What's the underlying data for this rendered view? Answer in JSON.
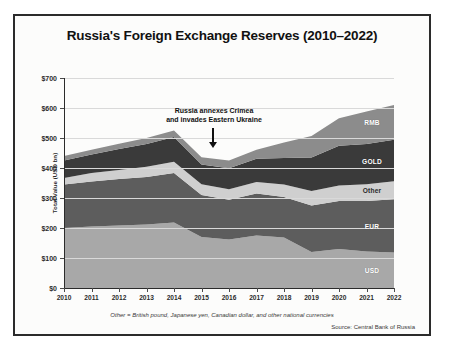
{
  "chart_data": {
    "type": "area",
    "stacked": true,
    "title": "Russia's Foreign Exchange Reserves (2010–2022)",
    "xlabel": "",
    "ylabel": "Total Value (USD bn)",
    "ylim": [
      0,
      700
    ],
    "ytick_step": 100,
    "ytick_labels": [
      "$0",
      "$100",
      "$200",
      "$300",
      "$400",
      "$500",
      "$600",
      "$700"
    ],
    "grid": true,
    "legend_position": "inline-right-edge",
    "categories": [
      2010,
      2011,
      2012,
      2013,
      2014,
      2015,
      2016,
      2017,
      2018,
      2019,
      2020,
      2021,
      2022
    ],
    "tick_labels": [
      "2010",
      "2011",
      "2012",
      "2013",
      "2014",
      "2015",
      "2016",
      "2017",
      "2018",
      "2019",
      "2020",
      "2021",
      "2022"
    ],
    "series": [
      {
        "name": "USD",
        "color": "#a8a8a8",
        "values": [
          200,
          205,
          208,
          212,
          218,
          170,
          162,
          175,
          168,
          120,
          130,
          122,
          118
        ]
      },
      {
        "name": "EUR",
        "color": "#5d5d5d",
        "values": [
          145,
          150,
          155,
          158,
          165,
          140,
          132,
          140,
          135,
          155,
          160,
          168,
          178
        ]
      },
      {
        "name": "Other",
        "color": "#cfcfcf",
        "values": [
          22,
          28,
          30,
          34,
          38,
          36,
          35,
          38,
          42,
          48,
          52,
          56,
          60
        ]
      },
      {
        "name": "GOLD",
        "color": "#3a3a3a",
        "values": [
          58,
          62,
          70,
          76,
          82,
          66,
          70,
          78,
          88,
          112,
          132,
          134,
          138
        ]
      },
      {
        "name": "RMB",
        "color": "#8c8c8c",
        "values": [
          15,
          16,
          18,
          20,
          22,
          24,
          26,
          30,
          52,
          72,
          92,
          108,
          116
        ]
      }
    ],
    "annotations": [
      {
        "name": "crimea-annotation",
        "line1": "Russia annexes Crimea",
        "line2": "and invades Eastern Ukraine",
        "at_year": 2014
      }
    ],
    "footnote": "Other = British pound, Japanese yen, Canadian dollar, and other national currencies",
    "source": "Source: Central Bank of Russia"
  }
}
